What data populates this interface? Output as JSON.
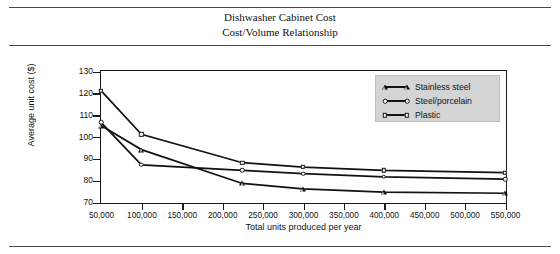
{
  "title": {
    "line1": "Dishwasher Cabinet Cost",
    "line2": "Cost/Volume Relationship"
  },
  "chart_data": {
    "type": "line",
    "xlabel": "Total units produced per year",
    "ylabel": "Average unit cost ($)",
    "xlim": [
      50000,
      550000
    ],
    "ylim": [
      70,
      130
    ],
    "yticks": [
      70,
      80,
      90,
      100,
      110,
      120,
      130
    ],
    "ytick_labels": [
      "70",
      "80",
      "90",
      "100",
      "110",
      "120",
      "130"
    ],
    "xticks": [
      50000,
      100000,
      150000,
      200000,
      250000,
      300000,
      350000,
      400000,
      450000,
      500000,
      550000
    ],
    "xtick_labels": [
      "50,000",
      "100,000",
      "150,000",
      "200,000",
      "250,000",
      "300,000",
      "350,000",
      "400,000",
      "450,000",
      "500,000",
      "550,000"
    ],
    "grid": false,
    "legend_position": "top-right",
    "series": [
      {
        "name": "Stainless steel",
        "marker": "triangle",
        "x": [
          50000,
          100000,
          225000,
          300000,
          400000,
          550000
        ],
        "values": [
          105.0,
          94.0,
          78.5,
          76.0,
          74.5,
          74.0
        ]
      },
      {
        "name": "Steel/porcelain",
        "marker": "circle",
        "x": [
          50000,
          100000,
          225000,
          300000,
          400000,
          550000
        ],
        "values": [
          106.5,
          87.0,
          84.5,
          83.0,
          81.5,
          80.5
        ]
      },
      {
        "name": "Plastic",
        "marker": "square",
        "x": [
          50000,
          100000,
          225000,
          300000,
          400000,
          550000
        ],
        "values": [
          121.0,
          101.0,
          88.0,
          86.0,
          84.5,
          83.5
        ]
      }
    ]
  },
  "legend": {
    "items": [
      {
        "label": "Stainless steel",
        "marker": "triangle"
      },
      {
        "label": "Steel/porcelain",
        "marker": "circle"
      },
      {
        "label": "Plastic",
        "marker": "square"
      }
    ]
  }
}
